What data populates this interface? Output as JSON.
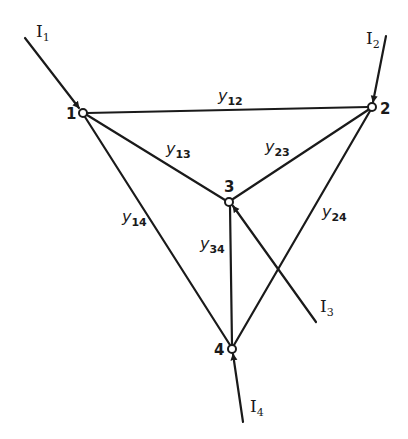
{
  "diagram": {
    "type": "network-graph",
    "nodes": [
      {
        "id": "1",
        "label": "1",
        "x": 83,
        "y": 113
      },
      {
        "id": "2",
        "label": "2",
        "x": 372,
        "y": 107
      },
      {
        "id": "3",
        "label": "3",
        "x": 229,
        "y": 202
      },
      {
        "id": "4",
        "label": "4",
        "x": 232,
        "y": 349
      }
    ],
    "edges": [
      {
        "from": "1",
        "to": "2",
        "label": "y",
        "sub": "12"
      },
      {
        "from": "1",
        "to": "3",
        "label": "y",
        "sub": "13"
      },
      {
        "from": "2",
        "to": "3",
        "label": "y",
        "sub": "23"
      },
      {
        "from": "1",
        "to": "4",
        "label": "y",
        "sub": "14"
      },
      {
        "from": "3",
        "to": "4",
        "label": "y",
        "sub": "34"
      },
      {
        "from": "2",
        "to": "4",
        "label": "y",
        "sub": "24"
      }
    ],
    "currents": [
      {
        "node": "1",
        "label": "I",
        "sub": "1",
        "direction": "into-node"
      },
      {
        "node": "2",
        "label": "I",
        "sub": "2",
        "direction": "into-node"
      },
      {
        "node": "3",
        "label": "I",
        "sub": "3",
        "direction": "into-node"
      },
      {
        "node": "4",
        "label": "I",
        "sub": "4",
        "direction": "into-node"
      }
    ]
  }
}
